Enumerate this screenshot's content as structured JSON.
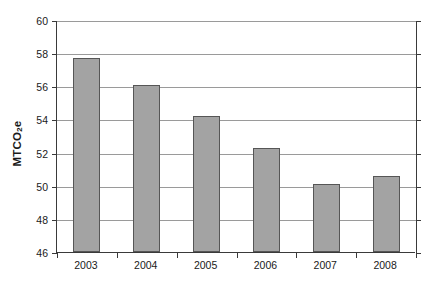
{
  "chart_data": {
    "type": "bar",
    "title": "",
    "xlabel": "",
    "ylabel": "MTCO2e",
    "ylabel_parts": {
      "prefix": "MTCO",
      "sub": "2",
      "suffix": "e"
    },
    "categories": [
      "2003",
      "2004",
      "2005",
      "2006",
      "2007",
      "2008"
    ],
    "values": [
      57.7,
      56.1,
      54.2,
      52.3,
      50.1,
      50.6
    ],
    "series": [
      {
        "name": "Emissions",
        "values": [
          57.7,
          56.1,
          54.2,
          52.3,
          50.1,
          50.6
        ]
      }
    ],
    "ylim": [
      46,
      60
    ],
    "yticks": [
      46,
      48,
      50,
      52,
      54,
      56,
      58,
      60
    ],
    "ytick_labels": [
      "46",
      "48",
      "50",
      "52",
      "54",
      "56",
      "58",
      "60"
    ],
    "xtick_labels": [
      "2003",
      "2004",
      "2005",
      "2006",
      "2007",
      "2008"
    ],
    "grid": true,
    "grid_axis": "y",
    "legend": false,
    "legend_position": "none",
    "bar_color": "#a3a3a3",
    "bar_edge_color": "#565656",
    "grid_color": "#9a9a9a",
    "axis_color": "#3a3a3a",
    "background_color": "#ffffff",
    "text_color": "#1a1a1a"
  }
}
